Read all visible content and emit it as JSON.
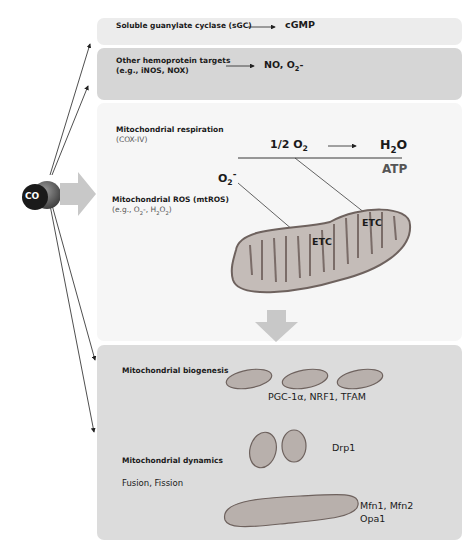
{
  "co_molecule": {
    "label": "CO"
  },
  "targets": {
    "sgc": {
      "label": "Soluble guanylate cyclase (sGC)",
      "product": "cGMP"
    },
    "hemoprotein": {
      "label": "Other hemoprotein targets",
      "examples": "(e.g., iNOS, NOX)",
      "product_no": "NO, O",
      "product_sub": "2",
      "product_suffix": "-"
    }
  },
  "mitochondria": {
    "respiration": {
      "label": "Mitochondrial respiration",
      "enzyme": "(COX-IV)",
      "reactant_prefix": "1/2 O",
      "reactant_sub": "2",
      "product_prefix": "H",
      "product_sub": "2",
      "product_suffix": "O",
      "atp": "ATP"
    },
    "ros": {
      "label": "Mitochondrial ROS (mtROS)",
      "examples_prefix": "(e.g., O",
      "examples_mid": "-, H",
      "examples_mid2": "O",
      "examples_suffix": ")",
      "superoxide": "O",
      "superoxide_sub": "2",
      "superoxide_sup": "-"
    },
    "etc_labels": [
      "ETC",
      "ETC"
    ]
  },
  "outcomes": {
    "biogenesis": {
      "label": "Mitochondrial biogenesis",
      "factors": "PGC-1α, NRF1, TFAM"
    },
    "dynamics": {
      "label": "Mitochondrial dynamics",
      "subtitle": "Fusion, Fission",
      "fission_factor": "Drp1",
      "fusion_factors_line1": "Mfn1, Mfn2",
      "fusion_factors_line2": "Opa1"
    }
  },
  "colors": {
    "box_light": "#ececec",
    "box_mid": "#d6d6d6",
    "box_faint": "#f6f6f6",
    "box_outcome": "#dcdcdc",
    "mito_fill": "#b8b0ac",
    "mito_stroke": "#6e625e",
    "big_arrow": "#c8c8c8"
  }
}
